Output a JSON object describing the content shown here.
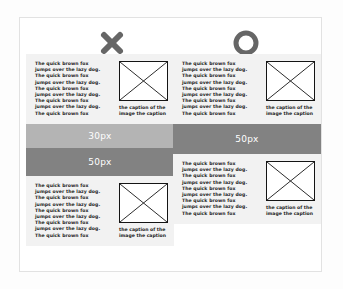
{
  "page": {
    "background": "#fdfdfd",
    "panel_background": "#ffffff",
    "panel_border": "#e2e2e2"
  },
  "marks": {
    "bad": {
      "icon": "cross-icon",
      "label": "✖",
      "color": "#666666"
    },
    "good": {
      "icon": "circle-icon",
      "label": "◯",
      "color": "#666666"
    }
  },
  "body_text": {
    "lines": [
      "The quick brown fox",
      "jumps over the lazy dog.",
      "The quick brown fox",
      "jumps over the lazy dog.",
      "The quick brown fox",
      "jumps over the lazy dog.",
      "The quick brown fox",
      "jumps over the lazy dog.",
      "The quick brown fox"
    ],
    "l0": "The quick brown fox",
    "l1": "jumps over the lazy dog.",
    "l2": "The quick brown fox",
    "l3": "jumps over the lazy dog.",
    "l4": "The quick brown fox",
    "l5": "jumps over the lazy dog.",
    "l6": "The quick brown fox",
    "l7": "jumps over the lazy dog.",
    "l8": "The quick brown fox"
  },
  "caption": {
    "line1": "the caption of the",
    "line2": "image the caption"
  },
  "image_placeholder": {
    "icon": "image-placeholder-icon",
    "border_color": "#141414",
    "fill": "#ffffff"
  },
  "columns": {
    "bad": {
      "name": "bad-example",
      "blocks": [
        {
          "type": "content"
        },
        {
          "type": "gap",
          "label": "30px",
          "color": "#b4b4b4"
        },
        {
          "type": "gap",
          "label": "50px",
          "color": "#828282"
        },
        {
          "type": "content"
        }
      ],
      "gap_top_label": "30px",
      "gap_bottom_label": "50px"
    },
    "good": {
      "name": "good-example",
      "blocks": [
        {
          "type": "content"
        },
        {
          "type": "gap",
          "label": "50px",
          "color": "#828282"
        },
        {
          "type": "content"
        }
      ],
      "gap_label": "50px"
    }
  },
  "colors": {
    "block_background": "#f2f2f2",
    "gap_light": "#b4b4b4",
    "gap_dark": "#828282",
    "text": "#1d1d1d",
    "gap_label_text": "#ffffff"
  }
}
